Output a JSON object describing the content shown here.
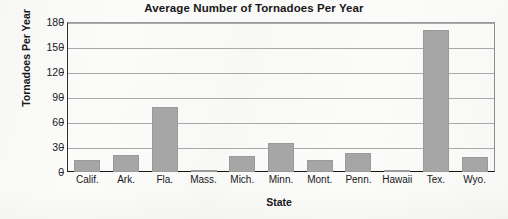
{
  "chart_data": {
    "type": "bar",
    "title": "Average Number of Tornadoes Per Year",
    "xlabel": "State",
    "ylabel": "Tornadoes Per Year",
    "categories": [
      "Calif.",
      "Ark.",
      "Fla.",
      "Mass.",
      "Mich.",
      "Minn.",
      "Mont.",
      "Penn.",
      "Hawaii",
      "Tex.",
      "Wyo."
    ],
    "values": [
      14,
      21,
      78,
      3,
      19,
      35,
      14,
      23,
      1,
      170,
      18
    ],
    "series": [
      {
        "name": "Average Number of Tornadoes Per Year",
        "values": [
          14,
          21,
          78,
          3,
          19,
          35,
          14,
          23,
          1,
          170,
          18
        ]
      }
    ],
    "ylim": [
      0,
      180
    ],
    "yticks": [
      0,
      30,
      60,
      90,
      120,
      150,
      180
    ],
    "ytick_labels": [
      "0",
      "30",
      "60",
      "90",
      "120",
      "150",
      "180"
    ],
    "grid": "horizontal",
    "legend": "none",
    "bar_color": "#a6a6a6",
    "gridline_color": "#a9a9a9",
    "axis_color": "#141414",
    "text_color": "#17171a",
    "background_color": "#fbfbf9"
  }
}
